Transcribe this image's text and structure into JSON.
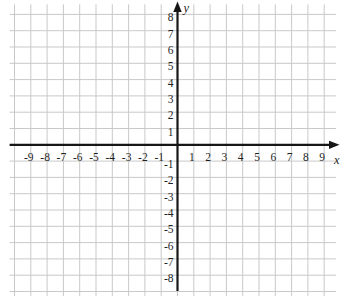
{
  "page": {
    "background_color": "#ffffff"
  },
  "chart_data": {
    "type": "scatter",
    "title": "",
    "subtitle": "",
    "xlabel": "x",
    "ylabel": "y",
    "series": [],
    "x_ticks": [
      -9,
      -8,
      -7,
      -6,
      -5,
      -4,
      -3,
      -2,
      -1,
      1,
      2,
      3,
      4,
      5,
      6,
      7,
      8,
      9
    ],
    "y_ticks": [
      8,
      7,
      6,
      5,
      4,
      3,
      2,
      1,
      -1,
      -2,
      -3,
      -4,
      -5,
      -6,
      -7,
      -8
    ],
    "xlim": [
      -10.3,
      9.72
    ],
    "ylim": [
      -9.28,
      8.62
    ],
    "grid": true,
    "legend": "none",
    "axis_color": "#161616",
    "grid_color": "#c9c9c9",
    "tick_label_color": "#1f1f1f",
    "background_color": "#ffffff"
  }
}
